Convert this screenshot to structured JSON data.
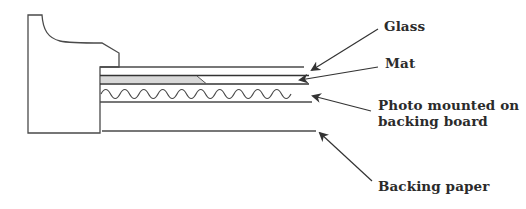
{
  "diagram": {
    "colors": {
      "line": "#4a4a4a",
      "mat_fill": "#d8d8d8",
      "text": "#2b2b2b",
      "background": "#ffffff"
    },
    "labels": [
      {
        "id": "glass",
        "text": "Glass"
      },
      {
        "id": "mat",
        "text": "Mat"
      },
      {
        "id": "photo",
        "line1": "Photo mounted on",
        "line2": "backing board"
      },
      {
        "id": "backing_paper",
        "text": "Backing paper"
      }
    ]
  }
}
